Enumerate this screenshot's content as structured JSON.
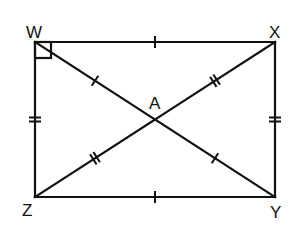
{
  "diagram": {
    "type": "rectangle-with-diagonals",
    "vertices": {
      "W": {
        "label": "W"
      },
      "X": {
        "label": "X"
      },
      "Y": {
        "label": "Y"
      },
      "Z": {
        "label": "Z"
      }
    },
    "intersection": {
      "label": "A"
    },
    "segments": [
      {
        "name": "WX",
        "from": "W",
        "to": "X",
        "ticks": 1
      },
      {
        "name": "XY",
        "from": "X",
        "to": "Y",
        "ticks": 2
      },
      {
        "name": "YZ",
        "from": "Y",
        "to": "Z",
        "ticks": 1
      },
      {
        "name": "ZW",
        "from": "Z",
        "to": "W",
        "ticks": 2
      },
      {
        "name": "WA",
        "from": "W",
        "to": "A",
        "ticks": 1
      },
      {
        "name": "AY",
        "from": "A",
        "to": "Y",
        "ticks": 1
      },
      {
        "name": "XA",
        "from": "X",
        "to": "A",
        "ticks": 2
      },
      {
        "name": "AZ",
        "from": "A",
        "to": "Z",
        "ticks": 2
      }
    ],
    "right_angle_at": "W",
    "stroke_color": "#111111"
  }
}
